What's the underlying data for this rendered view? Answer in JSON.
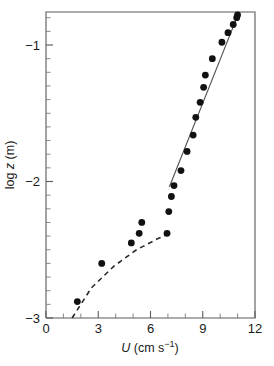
{
  "chart_data": {
    "type": "scatter",
    "title": "",
    "xlabel": "U (cm s⁻¹)",
    "xlabel_symbol": "U",
    "xlabel_rest": " (cm s",
    "xlabel_sup": "−1",
    "xlabel_tail": ")",
    "ylabel": "log z (m)",
    "ylabel_pre": "log ",
    "ylabel_symbol": "z",
    "ylabel_post": " (m)",
    "xlim": [
      0,
      12
    ],
    "ylim": [
      -3.0,
      -0.76
    ],
    "xticks": [
      0,
      3,
      6,
      9,
      12
    ],
    "xticklabels": [
      "0",
      "3",
      "6",
      "9",
      "12"
    ],
    "x_minor_step": 1,
    "yticks": [
      -1,
      -2,
      -3
    ],
    "yticklabels": [
      "−1",
      "−2",
      "−3"
    ],
    "y_minor_step": 0.1,
    "grid": false,
    "legend": "none",
    "marker": "filled-circle",
    "series": [
      {
        "name": "velocity profile",
        "x": [
          1.8,
          3.2,
          4.9,
          5.35,
          5.5,
          6.95,
          7.05,
          7.2,
          7.35,
          7.75,
          8.1,
          8.45,
          8.6,
          8.85,
          9.05,
          9.15,
          9.55,
          10.1,
          10.45,
          10.75,
          10.95,
          11.0
        ],
        "y": [
          -2.88,
          -2.6,
          -2.45,
          -2.38,
          -2.3,
          -2.38,
          -2.22,
          -2.11,
          -2.03,
          -1.92,
          -1.78,
          -1.66,
          -1.53,
          -1.42,
          -1.31,
          -1.22,
          -1.1,
          -0.98,
          -0.91,
          -0.85,
          -0.8,
          -0.78
        ]
      }
    ],
    "fits": [
      {
        "name": "log-law fit",
        "style": "solid",
        "x": [
          7.08,
          11.05
        ],
        "y": [
          -2.04,
          -0.77
        ]
      },
      {
        "name": "lower-layer fit",
        "style": "dashed",
        "x": [
          1.5,
          2.6,
          3.9,
          5.2,
          6.4,
          7.25
        ],
        "y": [
          -3.0,
          -2.78,
          -2.62,
          -2.5,
          -2.42,
          -2.37
        ]
      }
    ]
  }
}
